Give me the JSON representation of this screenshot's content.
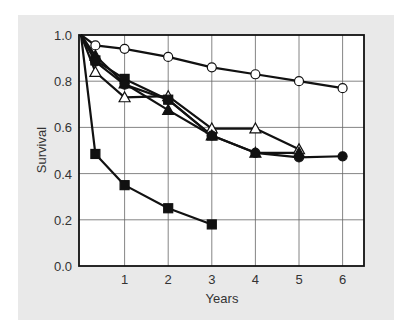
{
  "chart_data": {
    "type": "line",
    "title": "",
    "xlabel": "Years",
    "ylabel": "Survival",
    "xlim": [
      0,
      6.5
    ],
    "ylim": [
      0,
      1.0
    ],
    "x_ticks": [
      "1",
      "2",
      "3",
      "4",
      "5",
      "6"
    ],
    "y_ticks": [
      "0.0",
      "0.2",
      "0.4",
      "0.6",
      "0.8",
      "1.0"
    ],
    "grid": true,
    "legend": null,
    "series": [
      {
        "name": "open-circle",
        "marker": "circle-open",
        "x": [
          0,
          0.33,
          1,
          2,
          3,
          4,
          5,
          6
        ],
        "y": [
          1.0,
          0.955,
          0.94,
          0.905,
          0.86,
          0.83,
          0.8,
          0.77
        ]
      },
      {
        "name": "filled-square-upper",
        "marker": "square-filled",
        "x": [
          0,
          0.33,
          1,
          2,
          3
        ],
        "y": [
          1.0,
          0.89,
          0.81,
          0.72,
          0.565
        ]
      },
      {
        "name": "open-triangle",
        "marker": "triangle-open",
        "x": [
          0,
          0.33,
          1,
          2,
          3,
          4,
          5
        ],
        "y": [
          1.0,
          0.84,
          0.73,
          0.735,
          0.595,
          0.595,
          0.505
        ]
      },
      {
        "name": "filled-triangle",
        "marker": "triangle-filled",
        "x": [
          0,
          0.33,
          1,
          2,
          3,
          4,
          5
        ],
        "y": [
          1.0,
          0.91,
          0.79,
          0.675,
          0.565,
          0.49,
          0.49
        ]
      },
      {
        "name": "filled-circle",
        "marker": "circle-filled",
        "x": [
          0,
          0.33,
          1,
          2,
          3,
          4,
          5,
          6
        ],
        "y": [
          1.0,
          0.885,
          0.785,
          0.72,
          0.565,
          0.49,
          0.47,
          0.475
        ]
      },
      {
        "name": "filled-square-lower",
        "marker": "square-filled",
        "x": [
          0,
          0.33,
          1,
          2,
          3
        ],
        "y": [
          1.0,
          0.485,
          0.35,
          0.25,
          0.18
        ]
      }
    ]
  },
  "colors": {
    "panel": "#e9e9e9",
    "plot_bg": "#ffffff",
    "line": "#111111",
    "grid": "#555555",
    "text": "#333333"
  }
}
